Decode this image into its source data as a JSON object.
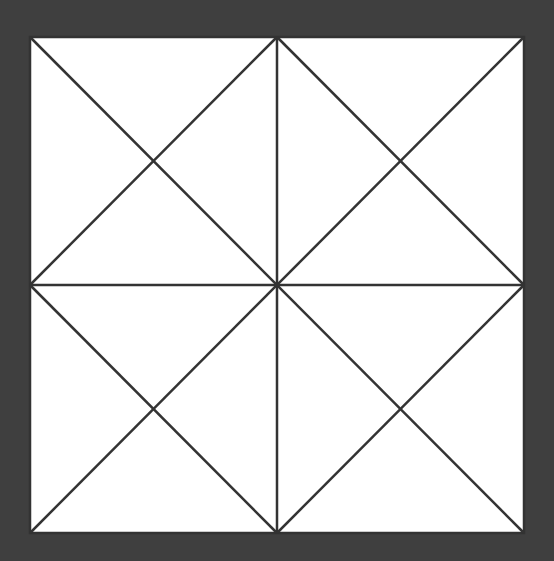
{
  "diagram": {
    "background_color": "#3f3f3f",
    "square_fill": "#ffffff",
    "line_color": "#333333",
    "square": {
      "x": 30,
      "y": 37,
      "width": 494,
      "height": 496
    },
    "lines": [
      {
        "name": "diagonal-tl-br",
        "x1": 30,
        "y1": 37,
        "x2": 524,
        "y2": 533
      },
      {
        "name": "diagonal-tr-bl",
        "x1": 524,
        "y1": 37,
        "x2": 30,
        "y2": 533
      },
      {
        "name": "vertical-midline",
        "x1": 277,
        "y1": 37,
        "x2": 277,
        "y2": 533
      },
      {
        "name": "horizontal-midline",
        "x1": 30,
        "y1": 285,
        "x2": 524,
        "y2": 285
      },
      {
        "name": "diamond-top-left",
        "x1": 277,
        "y1": 37,
        "x2": 30,
        "y2": 285
      },
      {
        "name": "diamond-left-bottom",
        "x1": 30,
        "y1": 285,
        "x2": 277,
        "y2": 533
      },
      {
        "name": "diamond-bottom-right",
        "x1": 277,
        "y1": 533,
        "x2": 524,
        "y2": 285
      },
      {
        "name": "diamond-right-top",
        "x1": 524,
        "y1": 285,
        "x2": 277,
        "y2": 37
      }
    ]
  }
}
